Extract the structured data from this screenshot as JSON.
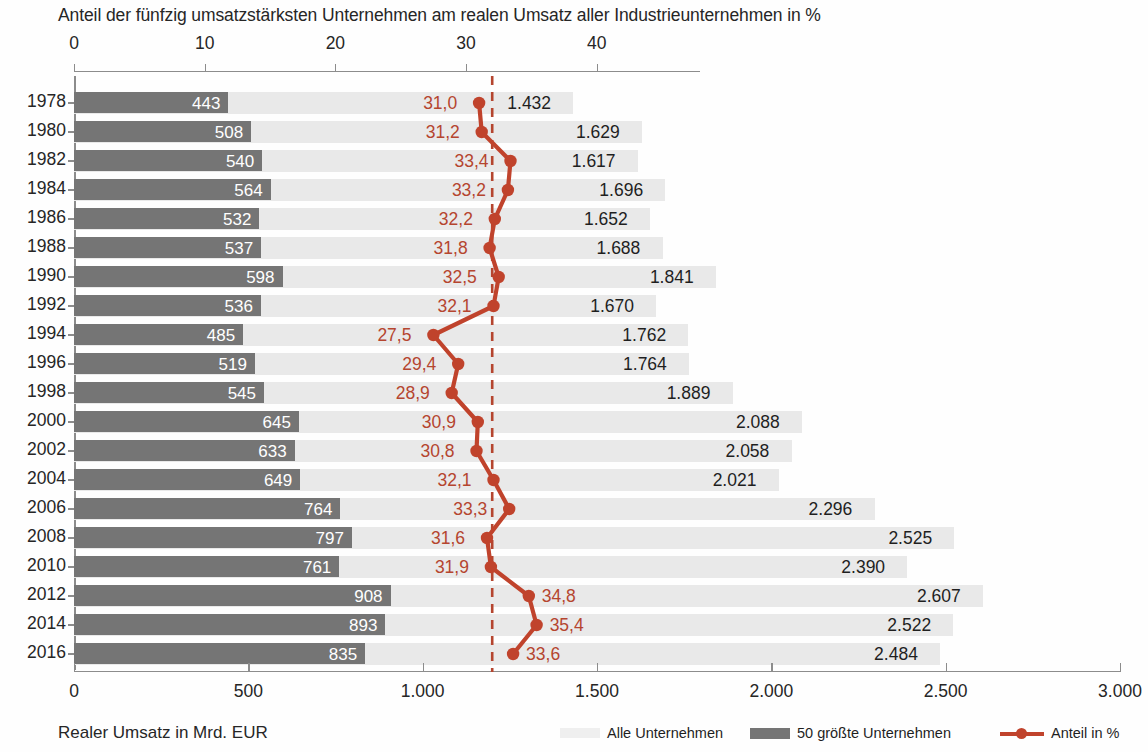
{
  "chart_data": {
    "type": "bar",
    "title": "Anteil der fünfzig umsatzstärksten Unternehmen am realen Umsatz aller Industrieunternehmen in %",
    "xlabel": "Realer Umsatz in Mrd. EUR",
    "ylabel": "",
    "grid": false,
    "legend_position": "bottom-right",
    "axes": {
      "bottom": {
        "label": "Realer Umsatz in Mrd. EUR",
        "ticks": [
          "0",
          "500",
          "1.000",
          "1.500",
          "2.000",
          "2.500",
          "3.000"
        ],
        "tick_values": [
          0,
          500,
          1000,
          1500,
          2000,
          2500,
          3000
        ],
        "lim": [
          0,
          3000
        ]
      },
      "top": {
        "label": "Anteil in %",
        "ticks": [
          "0",
          "10",
          "20",
          "30",
          "40"
        ],
        "tick_values": [
          0,
          10,
          20,
          30,
          40
        ],
        "lim": [
          0,
          47.9
        ]
      }
    },
    "reference_line": {
      "value": 32.0,
      "style": "dashed",
      "color": "#b5452f"
    },
    "categories": [
      "1978",
      "1980",
      "1982",
      "1984",
      "1986",
      "1988",
      "1990",
      "1992",
      "1994",
      "1996",
      "1998",
      "2000",
      "2002",
      "2004",
      "2006",
      "2008",
      "2010",
      "2012",
      "2014",
      "2016"
    ],
    "series": [
      {
        "name": "Alle Unternehmen",
        "key": "all",
        "color": "#e9e9e9",
        "unit": "Mrd. EUR",
        "labels": [
          "1.432",
          "1.629",
          "1.617",
          "1.696",
          "1.652",
          "1.688",
          "1.841",
          "1.670",
          "1.762",
          "1.764",
          "1.889",
          "2.088",
          "2.058",
          "2.021",
          "2.296",
          "2.525",
          "2.390",
          "2.607",
          "2.522",
          "2.484"
        ],
        "values": [
          1432,
          1629,
          1617,
          1696,
          1652,
          1688,
          1841,
          1670,
          1762,
          1764,
          1889,
          2088,
          2058,
          2021,
          2296,
          2525,
          2390,
          2607,
          2522,
          2484
        ]
      },
      {
        "name": "50 größte Unternehmen",
        "key": "top50",
        "color": "#757575",
        "unit": "Mrd. EUR",
        "labels": [
          "443",
          "508",
          "540",
          "564",
          "532",
          "537",
          "598",
          "536",
          "485",
          "519",
          "545",
          "645",
          "633",
          "649",
          "764",
          "797",
          "761",
          "908",
          "893",
          "835"
        ],
        "values": [
          443,
          508,
          540,
          564,
          532,
          537,
          598,
          536,
          485,
          519,
          545,
          645,
          633,
          649,
          764,
          797,
          761,
          908,
          893,
          835
        ]
      },
      {
        "name": "Anteil in %",
        "key": "share",
        "color": "#c0432c",
        "unit": "%",
        "labels": [
          "31,0",
          "31,2",
          "33,4",
          "33,2",
          "32,2",
          "31,8",
          "32,5",
          "32,1",
          "27,5",
          "29,4",
          "28,9",
          "30,9",
          "30,8",
          "32,1",
          "33,3",
          "31,6",
          "31,9",
          "34,8",
          "35,4",
          "33,6"
        ],
        "values": [
          31.0,
          31.2,
          33.4,
          33.2,
          32.2,
          31.8,
          32.5,
          32.1,
          27.5,
          29.4,
          28.9,
          30.9,
          30.8,
          32.1,
          33.3,
          31.6,
          31.9,
          34.8,
          35.4,
          33.6
        ]
      }
    ]
  },
  "legend": {
    "items": [
      {
        "label": "Alle Unternehmen",
        "swatch": "light-bar-swatch"
      },
      {
        "label": "50 größte Unternehmen",
        "swatch": "dark-bar-swatch"
      },
      {
        "label": "Anteil in %",
        "swatch": "red-line-swatch"
      }
    ]
  },
  "colors": {
    "bar_all": "#e9e9e9",
    "bar_top50": "#757575",
    "share_line": "#c0432c",
    "share_label": "#b5452f",
    "axis": "#8c8c8c",
    "text": "#262626"
  }
}
